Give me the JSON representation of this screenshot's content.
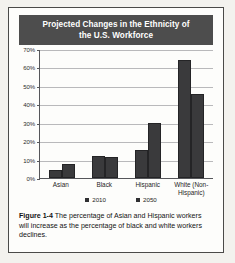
{
  "figure": {
    "caption_label": "Figure 1-4",
    "caption_text": " The percentage of Asian and Hispanic workers will increase as the percentage of black and white workers declines."
  },
  "legend": {
    "entries": [
      {
        "label": "2010"
      },
      {
        "label": "2050"
      }
    ]
  },
  "axis": {
    "y_ticks": [
      "70%",
      "60%",
      "50%",
      "40%",
      "30%",
      "20%",
      "10%",
      "0%"
    ]
  },
  "chart_data": {
    "type": "bar",
    "title": "Projected Changes in the Ethnicity of the U.S. Workforce",
    "title_line1": "Projected Changes in the Ethnicity of",
    "title_line2": "the U.S. Workforce",
    "xlabel": "",
    "ylabel": "",
    "ylim": [
      0,
      70
    ],
    "y_tick_step": 10,
    "grid": true,
    "legend_position": "bottom",
    "categories": [
      "Asian",
      "Black",
      "Hispanic",
      "White (Non-Hispanic)"
    ],
    "category_labels": [
      {
        "line1": "Asian",
        "line2": ""
      },
      {
        "line1": "Black",
        "line2": ""
      },
      {
        "line1": "Hispanic",
        "line2": ""
      },
      {
        "line1": "White (Non-",
        "line2": "Hispanic)"
      }
    ],
    "series": [
      {
        "name": "2010",
        "values": [
          4.5,
          11.8,
          15.2,
          64
        ]
      },
      {
        "name": "2050",
        "values": [
          7.5,
          11.3,
          29.8,
          45.5
        ]
      }
    ],
    "colors": {
      "bar": "#3a3a3c",
      "title_bar": "#4d4d4d",
      "title_text": "#ffffff",
      "gridline": "#b9b9bb",
      "axis": "#55565a"
    }
  }
}
